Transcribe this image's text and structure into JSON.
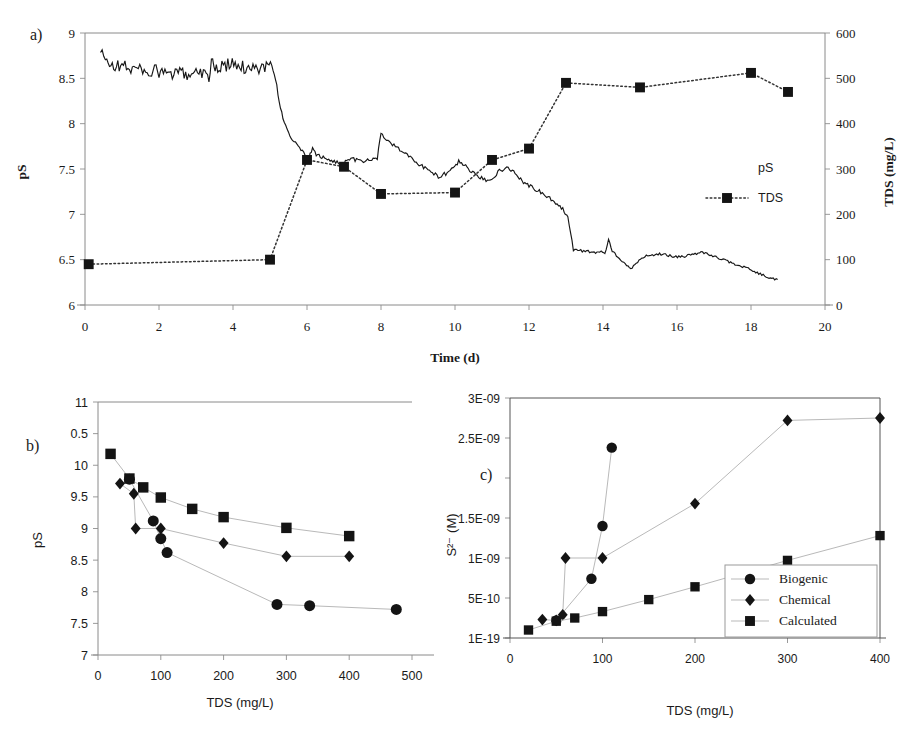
{
  "figure": {
    "panel_labels": {
      "a": "a)",
      "b": "b)",
      "c": "c)"
    }
  },
  "chart_data": [
    {
      "id": "panel-a",
      "type": "line",
      "title": "",
      "panel_label": "a)",
      "xlabel": "Time (d)",
      "ylabel": "pS",
      "y2label": "TDS (mg/L)",
      "xlim": [
        0,
        20
      ],
      "xticks": [
        0,
        2,
        4,
        6,
        8,
        10,
        12,
        14,
        16,
        18,
        20
      ],
      "xticklabels": [
        "0",
        "2",
        "4",
        "6",
        "8",
        "10",
        "12",
        "14",
        "16",
        "18",
        "20"
      ],
      "ylim": [
        9,
        6
      ],
      "y_inverted": true,
      "yticks": [
        6,
        6.5,
        7,
        7.5,
        8,
        8.5,
        9
      ],
      "yticklabels": [
        "6",
        "6.5",
        "7",
        "7.5",
        "8",
        "8.5",
        "9"
      ],
      "y2lim": [
        0,
        600
      ],
      "y2ticks": [
        0,
        100,
        200,
        300,
        400,
        500,
        600
      ],
      "y2ticklabels": [
        "0",
        "100",
        "200",
        "300",
        "400",
        "500",
        "600"
      ],
      "grid": false,
      "legend_position": "inside-right",
      "series": [
        {
          "name": "pS",
          "axis": "left",
          "style": "solid-noisy-line",
          "marker": "none",
          "points": [
            [
              0.42,
              8.78
            ],
            [
              0.55,
              8.7
            ],
            [
              0.7,
              8.66
            ],
            [
              0.85,
              8.63
            ],
            [
              1.0,
              8.64
            ],
            [
              1.2,
              8.62
            ],
            [
              1.4,
              8.6
            ],
            [
              1.6,
              8.59
            ],
            [
              1.8,
              8.58
            ],
            [
              2.0,
              8.57
            ],
            [
              2.2,
              8.55
            ],
            [
              2.4,
              8.54
            ],
            [
              2.6,
              8.55
            ],
            [
              2.8,
              8.56
            ],
            [
              3.0,
              8.57
            ],
            [
              3.2,
              8.58
            ],
            [
              3.35,
              8.52
            ],
            [
              3.45,
              8.72
            ],
            [
              3.55,
              8.6
            ],
            [
              3.7,
              8.62
            ],
            [
              3.9,
              8.66
            ],
            [
              4.1,
              8.63
            ],
            [
              4.3,
              8.62
            ],
            [
              4.5,
              8.63
            ],
            [
              4.7,
              8.62
            ],
            [
              4.9,
              8.63
            ],
            [
              5.05,
              8.62
            ],
            [
              5.15,
              8.5
            ],
            [
              5.25,
              8.25
            ],
            [
              5.35,
              8.05
            ],
            [
              5.5,
              7.9
            ],
            [
              5.65,
              7.8
            ],
            [
              5.8,
              7.72
            ],
            [
              5.95,
              7.66
            ],
            [
              6.05,
              7.62
            ],
            [
              6.15,
              7.72
            ],
            [
              6.25,
              7.66
            ],
            [
              6.4,
              7.63
            ],
            [
              6.55,
              7.6
            ],
            [
              6.7,
              7.59
            ],
            [
              6.85,
              7.57
            ],
            [
              7.0,
              7.56
            ],
            [
              7.15,
              7.62
            ],
            [
              7.3,
              7.6
            ],
            [
              7.45,
              7.58
            ],
            [
              7.6,
              7.59
            ],
            [
              7.75,
              7.6
            ],
            [
              7.9,
              7.62
            ],
            [
              8.0,
              7.9
            ],
            [
              8.15,
              7.82
            ],
            [
              8.35,
              7.76
            ],
            [
              8.55,
              7.7
            ],
            [
              8.75,
              7.64
            ],
            [
              8.95,
              7.58
            ],
            [
              9.15,
              7.52
            ],
            [
              9.35,
              7.46
            ],
            [
              9.55,
              7.42
            ],
            [
              9.75,
              7.45
            ],
            [
              9.95,
              7.52
            ],
            [
              10.1,
              7.58
            ],
            [
              10.25,
              7.55
            ],
            [
              10.4,
              7.48
            ],
            [
              10.6,
              7.42
            ],
            [
              10.8,
              7.38
            ],
            [
              11.0,
              7.4
            ],
            [
              11.2,
              7.48
            ],
            [
              11.4,
              7.52
            ],
            [
              11.55,
              7.48
            ],
            [
              11.7,
              7.42
            ],
            [
              11.85,
              7.36
            ],
            [
              12.0,
              7.32
            ],
            [
              12.2,
              7.27
            ],
            [
              12.4,
              7.22
            ],
            [
              12.6,
              7.16
            ],
            [
              12.8,
              7.1
            ],
            [
              12.95,
              7.04
            ],
            [
              13.05,
              6.98
            ],
            [
              13.2,
              6.61
            ],
            [
              13.4,
              6.6
            ],
            [
              13.6,
              6.59
            ],
            [
              13.8,
              6.58
            ],
            [
              13.95,
              6.59
            ],
            [
              14.05,
              6.57
            ],
            [
              14.15,
              6.72
            ],
            [
              14.25,
              6.6
            ],
            [
              14.4,
              6.52
            ],
            [
              14.6,
              6.45
            ],
            [
              14.75,
              6.4
            ],
            [
              14.9,
              6.46
            ],
            [
              15.05,
              6.52
            ],
            [
              15.25,
              6.55
            ],
            [
              15.45,
              6.56
            ],
            [
              15.65,
              6.56
            ],
            [
              15.85,
              6.54
            ],
            [
              16.05,
              6.53
            ],
            [
              16.25,
              6.54
            ],
            [
              16.45,
              6.56
            ],
            [
              16.65,
              6.58
            ],
            [
              16.85,
              6.56
            ],
            [
              17.05,
              6.53
            ],
            [
              17.25,
              6.5
            ],
            [
              17.45,
              6.47
            ],
            [
              17.65,
              6.44
            ],
            [
              17.85,
              6.41
            ],
            [
              18.05,
              6.38
            ],
            [
              18.25,
              6.34
            ],
            [
              18.45,
              6.31
            ],
            [
              18.6,
              6.29
            ],
            [
              18.72,
              6.28
            ]
          ]
        },
        {
          "name": "TDS",
          "axis": "right",
          "style": "dotted",
          "marker": "square",
          "points": [
            [
              0.1,
              90
            ],
            [
              5.0,
              100
            ],
            [
              6.0,
              320
            ],
            [
              7.0,
              305
            ],
            [
              8.0,
              245
            ],
            [
              10.0,
              248
            ],
            [
              11.0,
              320
            ],
            [
              12.0,
              345
            ],
            [
              13.0,
              490
            ],
            [
              15.0,
              480
            ],
            [
              18.0,
              512
            ],
            [
              19.0,
              470
            ]
          ]
        }
      ],
      "legend": [
        {
          "label": "pS",
          "marker": "none",
          "line": "none"
        },
        {
          "label": "TDS",
          "marker": "square",
          "line": "dotted"
        }
      ]
    },
    {
      "id": "panel-b",
      "type": "scatter",
      "title": "",
      "panel_label": "b)",
      "xlabel": "TDS (mg/L)",
      "ylabel": "pS",
      "xlim": [
        0,
        500
      ],
      "xticks": [
        0,
        100,
        200,
        300,
        400,
        500
      ],
      "xticklabels": [
        "0",
        "100",
        "200",
        "300",
        "400",
        "500"
      ],
      "ylim": [
        7,
        11
      ],
      "yticks": [
        7,
        7.5,
        8,
        8.5,
        9,
        9.5,
        10,
        10.5,
        11
      ],
      "yticklabels": [
        "7",
        "7.5",
        "8",
        "8.5",
        "9",
        "9.5",
        "10",
        "0.5",
        "11"
      ],
      "grid": false,
      "legend_position": "none",
      "series": [
        {
          "name": "Biogenic",
          "marker": "circle",
          "points": [
            [
              50,
              9.78
            ],
            [
              88,
              9.12
            ],
            [
              100,
              8.84
            ],
            [
              110,
              8.62
            ],
            [
              285,
              7.8
            ],
            [
              337,
              7.78
            ],
            [
              475,
              7.72
            ]
          ]
        },
        {
          "name": "Chemical",
          "marker": "diamond",
          "points": [
            [
              35,
              9.71
            ],
            [
              57,
              9.55
            ],
            [
              60,
              9.0
            ],
            [
              100,
              9.0
            ],
            [
              200,
              8.77
            ],
            [
              300,
              8.56
            ],
            [
              400,
              8.56
            ]
          ]
        },
        {
          "name": "Calculated",
          "marker": "square",
          "points": [
            [
              20,
              10.18
            ],
            [
              50,
              9.79
            ],
            [
              72,
              9.65
            ],
            [
              100,
              9.49
            ],
            [
              150,
              9.31
            ],
            [
              200,
              9.18
            ],
            [
              300,
              9.01
            ],
            [
              400,
              8.88
            ]
          ]
        }
      ]
    },
    {
      "id": "panel-c",
      "type": "scatter",
      "title": "",
      "panel_label": "c)",
      "xlabel": "TDS (mg/L)",
      "ylabel": "S2- (M)",
      "ylabel_display": "S²⁻ (M)",
      "xlim": [
        0,
        400
      ],
      "xticks": [
        0,
        100,
        200,
        300,
        400
      ],
      "xticklabels": [
        "0",
        "100",
        "200",
        "300",
        "400"
      ],
      "ylim": [
        0,
        3e-09
      ],
      "yticks": [
        0,
        5e-10,
        1e-09,
        1.5e-09,
        2e-09,
        2.5e-09,
        3e-09
      ],
      "yticklabels": [
        "1E-19",
        "5E-10",
        "1E-09",
        "1.5E-09",
        "",
        "2.5E-09",
        "3E-09"
      ],
      "grid": false,
      "legend_position": "inside-lower-right",
      "series": [
        {
          "name": "Biogenic",
          "marker": "circle",
          "points": [
            [
              50,
              2.2e-10
            ],
            [
              88,
              7.4e-10
            ],
            [
              100,
              1.4e-09
            ],
            [
              110,
              2.38e-09
            ]
          ]
        },
        {
          "name": "Chemical",
          "marker": "diamond",
          "points": [
            [
              35,
              2.3e-10
            ],
            [
              50,
              2.2e-10
            ],
            [
              57,
              2.9e-10
            ],
            [
              60,
              1e-09
            ],
            [
              100,
              1e-09
            ],
            [
              200,
              1.68e-09
            ],
            [
              300,
              2.72e-09
            ],
            [
              400,
              2.75e-09
            ]
          ]
        },
        {
          "name": "Calculated",
          "marker": "square",
          "points": [
            [
              20,
              1e-10
            ],
            [
              50,
              2.1e-10
            ],
            [
              70,
              2.5e-10
            ],
            [
              100,
              3.3e-10
            ],
            [
              150,
              4.8e-10
            ],
            [
              200,
              6.4e-10
            ],
            [
              300,
              9.7e-10
            ],
            [
              400,
              1.28e-09
            ]
          ]
        }
      ],
      "legend": [
        {
          "label": "Biogenic",
          "marker": "circle"
        },
        {
          "label": "Chemical",
          "marker": "diamond"
        },
        {
          "label": "Calculated",
          "marker": "square"
        }
      ]
    }
  ]
}
